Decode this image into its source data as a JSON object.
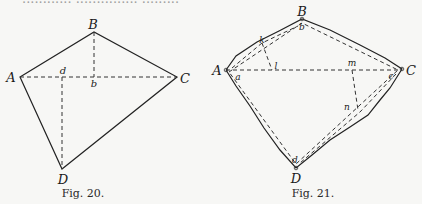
{
  "page": {
    "top_text_fragment": "............ ............... ........."
  },
  "figures": [
    {
      "id": "fig20",
      "caption": "Fig. 20.",
      "vertices": {
        "A": {
          "label": "A",
          "x": 20,
          "y": 77
        },
        "B": {
          "label": "B",
          "x": 94,
          "y": 32
        },
        "C": {
          "label": "C",
          "x": 177,
          "y": 77
        },
        "D": {
          "label": "D",
          "x": 62,
          "y": 169
        }
      },
      "inner_points": {
        "d": {
          "label": "d",
          "x": 62,
          "y": 77
        },
        "b": {
          "label": "b",
          "x": 94,
          "y": 77
        }
      },
      "solid_edges": [
        "A-B",
        "B-C",
        "C-D",
        "D-A"
      ],
      "dashed_lines": [
        "A-C",
        "B-b",
        "d-D"
      ]
    },
    {
      "id": "fig21",
      "caption": "Fig. 21.",
      "vertices": {
        "A": {
          "label": "A",
          "x": 226,
          "y": 70
        },
        "B": {
          "label": "B",
          "x": 302,
          "y": 19
        },
        "C": {
          "label": "C",
          "x": 402,
          "y": 69
        },
        "D": {
          "label": "D",
          "x": 296,
          "y": 168
        }
      },
      "inner_points": {
        "a": {
          "label": "a",
          "x": 238,
          "y": 76
        },
        "b": {
          "label": "b",
          "x": 302,
          "y": 26
        },
        "c": {
          "label": "c",
          "x": 392,
          "y": 75
        },
        "d": {
          "label": "d",
          "x": 295,
          "y": 160
        },
        "k": {
          "label": "k",
          "x": 262,
          "y": 41
        },
        "l": {
          "label": "l",
          "x": 275,
          "y": 67
        },
        "m": {
          "label": "m",
          "x": 352,
          "y": 63
        },
        "n": {
          "label": "n",
          "x": 347,
          "y": 107
        }
      },
      "solid_edges": [
        "A-k-B",
        "B-C",
        "C-n-D",
        "D-A"
      ],
      "dashed_lines": [
        "A-C",
        "k-l",
        "m-n",
        "inner offset polygon a-b-c-d"
      ]
    }
  ]
}
